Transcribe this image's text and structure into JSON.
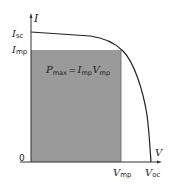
{
  "diagram": {
    "axes": {
      "y_label": "I",
      "x_label": "V",
      "origin_label": "0"
    },
    "y_ticks": [
      {
        "main": "I",
        "sub": "sc"
      },
      {
        "main": "I",
        "sub": "mp"
      }
    ],
    "x_ticks": [
      {
        "main": "V",
        "sub": "mp"
      },
      {
        "main": "V",
        "sub": "oc"
      }
    ],
    "equation": {
      "lhs_main": "P",
      "lhs_sub": "max",
      "equals": "=",
      "rhs1_main": "I",
      "rhs1_sub": "mp",
      "rhs2_main": "V",
      "rhs2_sub": "mp"
    },
    "colors": {
      "shade": "#9a9a9a",
      "curve": "#222222",
      "axis": "#333333"
    }
  }
}
